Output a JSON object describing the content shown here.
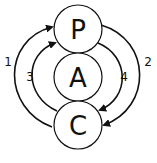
{
  "diagram": {
    "nodes": [
      {
        "id": "P",
        "label": "P"
      },
      {
        "id": "A",
        "label": "A"
      },
      {
        "id": "C",
        "label": "C"
      }
    ],
    "edges": [
      {
        "label": "1",
        "from": "C",
        "to": "P",
        "side": "left-outer"
      },
      {
        "label": "2",
        "from": "P",
        "to": "C",
        "side": "right-outer"
      },
      {
        "label": "3",
        "from": "C",
        "to": "P",
        "side": "left-inner"
      },
      {
        "label": "4",
        "from": "P",
        "to": "C",
        "side": "right-inner"
      }
    ],
    "colors": {
      "stroke": "#111111",
      "background": "#ffffff"
    }
  }
}
